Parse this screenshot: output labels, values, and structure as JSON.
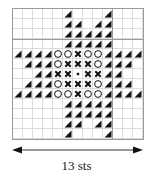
{
  "chart_data": {
    "type": "table",
    "columns": 13,
    "rows": 13,
    "legend_symbols": {
      "T": "filled-triangle",
      "O": "open-circle",
      "X": "cross",
      ".": "small-dot",
      "-": "empty"
    },
    "grid": [
      "-----T---T---",
      "-----TT-TT---",
      "-----TTTTT---",
      "-----TTTTT---",
      "TTTTOOXOOTTTT",
      "-TTTOXXXOTTT-",
      "--TTXX.XXTT--",
      "-TTTOXXXOTTT-",
      "TTTTOOXOOTTTT",
      "-----TTTTT---",
      "-----TTTTT---",
      "-----TT-TT---",
      "-----T---T---"
    ],
    "xlabel": "13 sts"
  },
  "footer": {
    "width_label": "13 sts"
  },
  "colors": {
    "ink": "#111111",
    "grid_line": "#dcdcdc",
    "major_grid_line": "#9a9a9a"
  }
}
